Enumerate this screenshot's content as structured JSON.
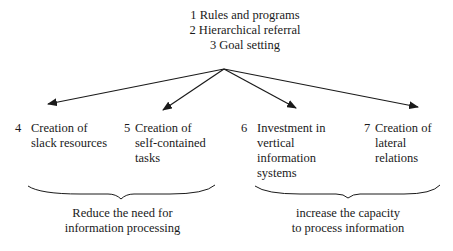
{
  "top_strategies": [
    "1 Rules and programs",
    "2 Hierarchical referral",
    "3 Goal setting"
  ],
  "branches": [
    {
      "number": "4",
      "lines": [
        "Creation of",
        "slack resources"
      ]
    },
    {
      "number": "5",
      "lines": [
        "Creation of",
        "self-contained",
        "tasks"
      ]
    },
    {
      "number": "6",
      "lines": [
        "Investment in",
        "vertical",
        "information",
        "systems"
      ]
    },
    {
      "number": "7",
      "lines": [
        "Creation of",
        "lateral",
        "relations"
      ]
    }
  ],
  "groups": [
    {
      "lines": [
        "Reduce the need for",
        "information processing"
      ]
    },
    {
      "lines": [
        "increase the capacity",
        "to process information"
      ]
    }
  ],
  "colors": {
    "ink": "#1a1a1a",
    "background": "#ffffff"
  }
}
